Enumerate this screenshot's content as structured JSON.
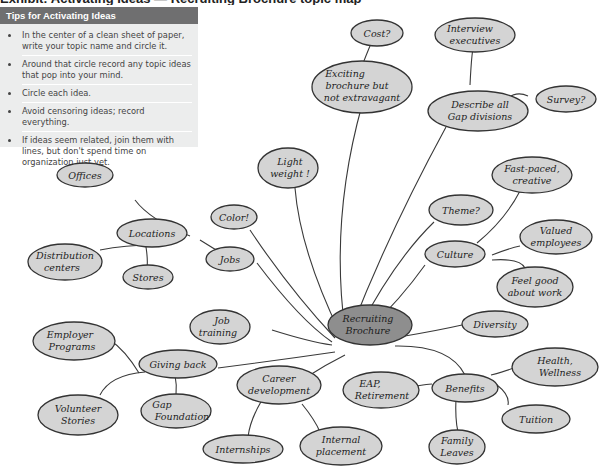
{
  "header": {
    "cutoff_title": "Exhibit: Activating Ideas — Recruiting Brochure topic map"
  },
  "tips": {
    "title": "Tips for Activating Ideas",
    "items": [
      "In the center of a clean sheet of paper, write your topic name and circle it.",
      "Around that circle record any topic ideas that pop into your mind.",
      "Circle each idea.",
      "Avoid censoring ideas; record everything.",
      "If ideas seem related, join them with lines, but don't spend time on organization just yet."
    ]
  },
  "colors": {
    "node_fill": "#d4d4d4",
    "center_fill": "#8e8e8e",
    "line": "#3a3a3a",
    "tips_bg": "#eceded",
    "tips_header": "#6f6f70"
  },
  "mindmap": {
    "center": {
      "l1": "Recruiting",
      "l2": "Brochure"
    },
    "nodes": {
      "cost": {
        "l1": "Cost?"
      },
      "interview": {
        "l1": "Interview",
        "l2": "executives"
      },
      "exciting": {
        "l1": "Exciting",
        "l2": "brochure but",
        "l3": "not extravagant"
      },
      "describe": {
        "l1": "Describe all",
        "l2": "Gap divisions"
      },
      "survey": {
        "l1": "Survey?"
      },
      "lightweight": {
        "l1": "Light",
        "l2": "weight !"
      },
      "offices": {
        "l1": "Offices"
      },
      "color": {
        "l1": "Color!"
      },
      "locations": {
        "l1": "Locations"
      },
      "distribution": {
        "l1": "Distribution",
        "l2": "centers"
      },
      "stores": {
        "l1": "Stores"
      },
      "jobs": {
        "l1": "Jobs"
      },
      "fastpaced": {
        "l1": "Fast-paced,",
        "l2": "creative"
      },
      "theme": {
        "l1": "Theme?"
      },
      "culture": {
        "l1": "Culture"
      },
      "valued": {
        "l1": "Valued",
        "l2": "employees"
      },
      "feelgood": {
        "l1": "Feel good",
        "l2": "about work"
      },
      "diversity": {
        "l1": "Diversity"
      },
      "jobtraining": {
        "l1": "Job",
        "l2": "training"
      },
      "employer": {
        "l1": "Employer",
        "l2": "Programs"
      },
      "givingback": {
        "l1": "Giving back"
      },
      "volunteer": {
        "l1": "Volunteer",
        "l2": "Stories"
      },
      "gapfoundation": {
        "l1": "Gap",
        "l2": "Foundation"
      },
      "career": {
        "l1": "Career",
        "l2": "development"
      },
      "internships": {
        "l1": "Internships"
      },
      "internal": {
        "l1": "Internal",
        "l2": "placement"
      },
      "eap": {
        "l1": "EAP,",
        "l2": "Retirement"
      },
      "benefits": {
        "l1": "Benefits"
      },
      "health": {
        "l1": "Health,",
        "l2": "Wellness"
      },
      "tuition": {
        "l1": "Tuition"
      },
      "family": {
        "l1": "Family",
        "l2": "Leaves"
      }
    }
  }
}
